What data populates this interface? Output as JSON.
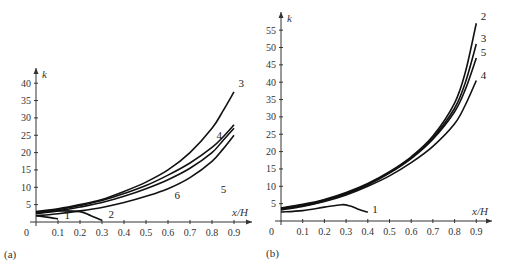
{
  "chart_data": [
    {
      "type": "line",
      "panel_label": "(a)",
      "xlabel": "x/H",
      "ylabel": "k",
      "xlim": [
        0,
        0.95
      ],
      "ylim": [
        0,
        42
      ],
      "xticks": [
        0.1,
        0.2,
        0.3,
        0.4,
        0.5,
        0.6,
        0.7,
        0.8,
        0.9
      ],
      "xtick_labels": [
        "0.1",
        "0.2",
        "0.3",
        "0.4",
        "0.5",
        "0.6",
        "0.7",
        "0.8",
        "0.9"
      ],
      "yticks": [
        5,
        10,
        15,
        20,
        25,
        30,
        35,
        40
      ],
      "ytick_labels": [
        "5",
        "10",
        "15",
        "20",
        "25",
        "30",
        "35",
        "40"
      ],
      "origin_label": "0",
      "grid": false,
      "series": [
        {
          "name": "1",
          "x": [
            0,
            0.05,
            0.1
          ],
          "y": [
            1.8,
            1.4,
            0.9
          ]
        },
        {
          "name": "2",
          "x": [
            0,
            0.1,
            0.2,
            0.25,
            0.3
          ],
          "y": [
            2.8,
            3.2,
            3.0,
            1.8,
            0.5
          ]
        },
        {
          "name": "3",
          "x": [
            0,
            0.1,
            0.2,
            0.3,
            0.4,
            0.5,
            0.6,
            0.7,
            0.8,
            0.85,
            0.9
          ],
          "y": [
            3.0,
            3.8,
            5.0,
            6.5,
            8.8,
            11.5,
            15.0,
            20.0,
            27.0,
            32.0,
            37.5
          ]
        },
        {
          "name": "4",
          "x": [
            0,
            0.1,
            0.2,
            0.3,
            0.4,
            0.5,
            0.6,
            0.7,
            0.8,
            0.85,
            0.9
          ],
          "y": [
            2.8,
            3.6,
            4.8,
            6.2,
            8.2,
            10.5,
            13.5,
            17.0,
            21.5,
            24.5,
            28.0
          ]
        },
        {
          "name": "5",
          "x": [
            0,
            0.1,
            0.2,
            0.3,
            0.4,
            0.5,
            0.6,
            0.7,
            0.8,
            0.85,
            0.9
          ],
          "y": [
            2.4,
            3.2,
            4.3,
            5.6,
            7.4,
            9.6,
            12.2,
            15.5,
            20.0,
            23.5,
            27.0
          ]
        },
        {
          "name": "6",
          "x": [
            0,
            0.1,
            0.2,
            0.3,
            0.4,
            0.5,
            0.6,
            0.7,
            0.8,
            0.85,
            0.9
          ],
          "y": [
            1.8,
            2.4,
            3.2,
            4.2,
            5.6,
            7.4,
            9.6,
            12.8,
            17.5,
            21.0,
            25.0
          ]
        }
      ],
      "label_positions": [
        {
          "name": "1",
          "x": 0.13,
          "y": 1.0
        },
        {
          "name": "2",
          "x": 0.33,
          "y": 1.2
        },
        {
          "name": "3",
          "x": 0.92,
          "y": 39
        },
        {
          "name": "4",
          "x": 0.82,
          "y": 24
        },
        {
          "name": "5",
          "x": 0.84,
          "y": 8.5
        },
        {
          "name": "6",
          "x": 0.63,
          "y": 6.5
        }
      ]
    },
    {
      "type": "line",
      "panel_label": "(b)",
      "xlabel": "x/H",
      "ylabel": "k",
      "xlim": [
        0,
        0.95
      ],
      "ylim": [
        0,
        58
      ],
      "xticks": [
        0.1,
        0.2,
        0.3,
        0.4,
        0.5,
        0.6,
        0.7,
        0.8,
        0.9
      ],
      "xtick_labels": [
        "0.1",
        "0.2",
        "0.3",
        "0.4",
        "0.5",
        "0.6",
        "0.7",
        "0.8",
        "0.9"
      ],
      "yticks": [
        5,
        10,
        15,
        20,
        25,
        30,
        35,
        40,
        45,
        50,
        55
      ],
      "ytick_labels": [
        "5",
        "10",
        "15",
        "20",
        "25",
        "30",
        "35",
        "40",
        "45",
        "50",
        "55"
      ],
      "origin_label": "0",
      "grid": false,
      "series": [
        {
          "name": "1",
          "x": [
            0,
            0.1,
            0.2,
            0.28,
            0.32,
            0.36,
            0.4
          ],
          "y": [
            2.6,
            3.0,
            4.0,
            4.7,
            4.3,
            3.3,
            2.5
          ]
        },
        {
          "name": "2",
          "x": [
            0,
            0.1,
            0.2,
            0.3,
            0.4,
            0.5,
            0.6,
            0.7,
            0.8,
            0.85,
            0.9
          ],
          "y": [
            3.8,
            4.8,
            6.2,
            8.2,
            10.8,
            14.2,
            18.5,
            24.5,
            34.0,
            43.0,
            57.0
          ]
        },
        {
          "name": "3",
          "x": [
            0,
            0.1,
            0.2,
            0.3,
            0.4,
            0.5,
            0.6,
            0.7,
            0.8,
            0.85,
            0.9
          ],
          "y": [
            3.6,
            4.6,
            6.0,
            8.0,
            10.6,
            14.0,
            18.2,
            24.0,
            32.5,
            40.0,
            51.0
          ]
        },
        {
          "name": "5",
          "x": [
            0,
            0.1,
            0.2,
            0.3,
            0.4,
            0.5,
            0.6,
            0.7,
            0.8,
            0.85,
            0.9
          ],
          "y": [
            3.4,
            4.4,
            5.8,
            7.8,
            10.4,
            13.8,
            18.0,
            23.6,
            31.5,
            38.0,
            47.0
          ]
        },
        {
          "name": "4",
          "x": [
            0,
            0.1,
            0.2,
            0.3,
            0.4,
            0.5,
            0.6,
            0.7,
            0.8,
            0.85,
            0.9
          ],
          "y": [
            3.2,
            4.2,
            5.6,
            7.5,
            10.0,
            13.0,
            16.8,
            21.5,
            28.0,
            33.5,
            40.5
          ]
        }
      ],
      "label_positions": [
        {
          "name": "1",
          "x": 0.42,
          "y": 2.2
        },
        {
          "name": "2",
          "x": 0.92,
          "y": 58
        },
        {
          "name": "3",
          "x": 0.92,
          "y": 51.5
        },
        {
          "name": "5",
          "x": 0.92,
          "y": 47.5
        },
        {
          "name": "4",
          "x": 0.92,
          "y": 41
        }
      ]
    }
  ]
}
